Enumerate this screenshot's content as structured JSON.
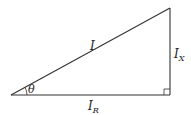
{
  "diagram": {
    "type": "phasor-triangle",
    "labels": {
      "hypotenuse": "I",
      "vertical_main": "I",
      "vertical_sub": "X",
      "horizontal_main": "I",
      "horizontal_sub": "R",
      "angle": "θ"
    },
    "colors": {
      "line": "#333333",
      "background": "#ffffff"
    }
  }
}
